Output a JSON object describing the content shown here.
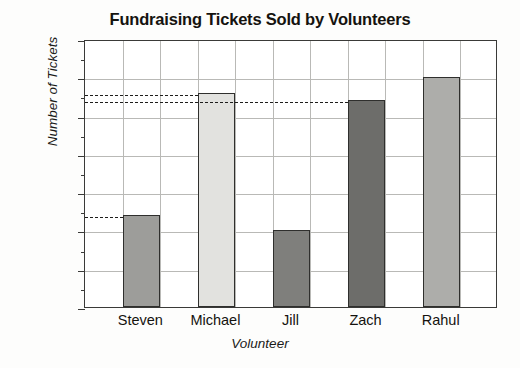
{
  "chart_data": {
    "type": "bar",
    "title": "Fundraising Tickets Sold by Volunteers",
    "xlabel": "Volunteer",
    "ylabel": "Number of Tickets",
    "categories": [
      "Steven",
      "Michael",
      "Jill",
      "Zach",
      "Rahul"
    ],
    "values": [
      12,
      28,
      10,
      27,
      30
    ],
    "bar_colors": [
      "#9d9d9a",
      "#e2e2df",
      "#7f7f7c",
      "#6d6d6a",
      "#adadaa"
    ],
    "ylim": [
      0,
      35
    ],
    "ytick_step": 5,
    "yticks": [
      0,
      5,
      10,
      15,
      20,
      25,
      30,
      35
    ],
    "ytick_labels": [
      "0",
      "5",
      "10",
      "15",
      "20",
      "25",
      "30",
      "35"
    ],
    "minor_tick_step": 2.5,
    "grid": true,
    "grid_axis": "both",
    "legend": false,
    "annotations": [
      {
        "label": "12",
        "value": 12,
        "style": "dashed",
        "from_category": "axis",
        "to_category": "Steven"
      },
      {
        "label": "28",
        "value": 28,
        "style": "dashed",
        "from_category": "axis",
        "to_category": "Michael"
      },
      {
        "label": "27",
        "value": 27,
        "style": "dashed",
        "from_category": "axis",
        "to_category": "Zach"
      }
    ]
  }
}
